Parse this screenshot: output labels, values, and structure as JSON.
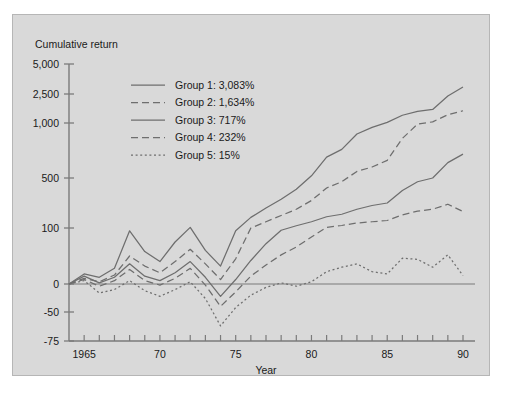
{
  "figure": {
    "background_color": "#d9d9d9",
    "border_color": "#b6b6b6",
    "page_background": "#ffffff"
  },
  "chart_data": {
    "type": "line",
    "title": "",
    "ylabel": "Cumulative return",
    "xlabel": "Year",
    "grid": false,
    "legend_position": "upper-left",
    "y_scale": "nonlinear-symmetric-log",
    "yticks": [
      5000,
      2500,
      1000,
      500,
      100,
      0,
      -50,
      -75
    ],
    "ytick_labels": [
      "5,000",
      "2,500",
      "1,000",
      "500",
      "100",
      "0",
      "-50",
      "-75"
    ],
    "ylim": [
      -75,
      5000
    ],
    "xlim": [
      1964,
      1990
    ],
    "xticks": [
      1965,
      1970,
      1975,
      1980,
      1985,
      1990
    ],
    "xtick_labels": [
      "1965",
      "70",
      "75",
      "80",
      "85",
      "90"
    ],
    "x_minor_tick_step": 1,
    "zero_line": true,
    "line_color": "#6e6e6e",
    "x": [
      1964,
      1965,
      1966,
      1967,
      1968,
      1969,
      1970,
      1971,
      1972,
      1973,
      1974,
      1975,
      1976,
      1977,
      1978,
      1979,
      1980,
      1981,
      1982,
      1983,
      1984,
      1985,
      1986,
      1987,
      1988,
      1989,
      1990
    ],
    "series": [
      {
        "name": "Group 1",
        "label": "Group 1: 3,083%",
        "final_value_label": "3,083%",
        "style": "solid",
        "values": [
          0,
          18,
          12,
          28,
          95,
          58,
          40,
          75,
          105,
          60,
          32,
          95,
          185,
          260,
          330,
          410,
          520,
          690,
          760,
          900,
          960,
          1030,
          1400,
          1600,
          1700,
          2400,
          3083
        ]
      },
      {
        "name": "Group 2",
        "label": "Group 2: 1,634%",
        "final_value_label": "1,634%",
        "style": "dashed",
        "values": [
          0,
          10,
          4,
          16,
          50,
          32,
          20,
          40,
          62,
          36,
          8,
          45,
          100,
          150,
          200,
          250,
          320,
          420,
          470,
          560,
          600,
          660,
          860,
          990,
          1060,
          1430,
          1634
        ]
      },
      {
        "name": "Group 3",
        "label": "Group 3:   717%",
        "final_value_label": "717%",
        "style": "solid",
        "values": [
          0,
          14,
          2,
          12,
          36,
          14,
          6,
          20,
          40,
          12,
          -22,
          8,
          42,
          72,
          96,
          118,
          150,
          190,
          210,
          250,
          280,
          300,
          400,
          470,
          500,
          640,
          717
        ]
      },
      {
        "name": "Group 4",
        "label": "Group 4:   232%",
        "final_value_label": "232%",
        "style": "dashed",
        "values": [
          0,
          8,
          -4,
          6,
          26,
          6,
          -2,
          10,
          28,
          -2,
          -40,
          -14,
          14,
          34,
          52,
          66,
          84,
          105,
          120,
          140,
          150,
          160,
          205,
          235,
          250,
          290,
          232
        ]
      },
      {
        "name": "Group 5",
        "label": "Group 5:     15%",
        "final_value_label": "15%",
        "style": "dotted",
        "values": [
          0,
          6,
          -16,
          -10,
          6,
          -12,
          -22,
          -10,
          4,
          -26,
          -62,
          -42,
          -20,
          -6,
          2,
          -4,
          4,
          22,
          30,
          36,
          22,
          18,
          46,
          44,
          30,
          52,
          15
        ]
      }
    ]
  }
}
